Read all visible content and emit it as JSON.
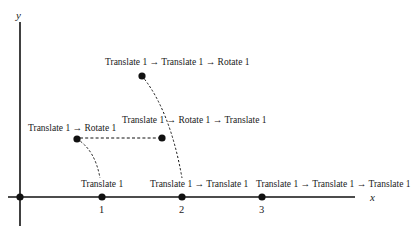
{
  "axes": {
    "x_label": "x",
    "y_label": "y",
    "ticks": [
      "1",
      "2",
      "3"
    ]
  },
  "points": [
    {
      "id": "origin",
      "label": ""
    },
    {
      "id": "t1",
      "label": "Translate 1"
    },
    {
      "id": "t1t1",
      "label": "Translate 1 → Translate 1"
    },
    {
      "id": "t1t1t1",
      "label": "Translate 1 → Translate 1 → Translate 1"
    },
    {
      "id": "t1r1",
      "label": "Translate 1 → Rotate 1"
    },
    {
      "id": "t1r1t1",
      "label": "Translate 1 → Rotate 1 → Translate 1"
    },
    {
      "id": "t1t1r1",
      "label": "Translate 1 → Translate 1 → Rotate 1"
    }
  ],
  "colors": {
    "ink": "#111111",
    "background": "#ffffff"
  }
}
